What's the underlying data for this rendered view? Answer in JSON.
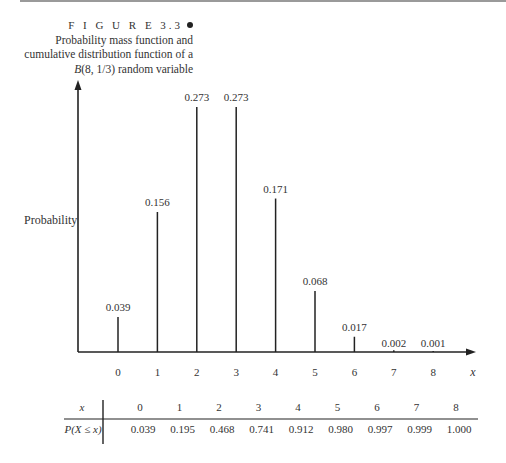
{
  "figure": {
    "label": "F I G U R E 3.3",
    "caption_lines": [
      "Probability mass function and",
      "cumulative distribution function of a"
    ],
    "caption_var": "B",
    "caption_tail": "(8, 1/3) random variable"
  },
  "chart_data": {
    "type": "bar",
    "subtype": "stem",
    "title": "Probability mass function and cumulative distribution function of a B(8, 1/3) random variable",
    "xlabel": "x",
    "ylabel": "Probability",
    "categories": [
      "0",
      "1",
      "2",
      "3",
      "4",
      "5",
      "6",
      "7",
      "8"
    ],
    "values": [
      0.039,
      0.156,
      0.273,
      0.273,
      0.171,
      0.068,
      0.017,
      0.002,
      0.001
    ],
    "data_labels": [
      "0.039",
      "0.156",
      "0.273",
      "0.273",
      "0.171",
      "0.068",
      "0.017",
      "0.002",
      "0.001"
    ],
    "ylim": [
      0,
      0.3
    ],
    "grid": false,
    "legend": "none",
    "cdf_table": {
      "row_headers": [
        "x",
        "P(X ≤ x)"
      ],
      "x": [
        "0",
        "1",
        "2",
        "3",
        "4",
        "5",
        "6",
        "7",
        "8"
      ],
      "cdf": [
        "0.039",
        "0.195",
        "0.468",
        "0.741",
        "0.912",
        "0.980",
        "0.997",
        "0.999",
        "1.000"
      ]
    }
  },
  "colors": {
    "ink": "#222222",
    "rule": "#9a9a9a"
  }
}
